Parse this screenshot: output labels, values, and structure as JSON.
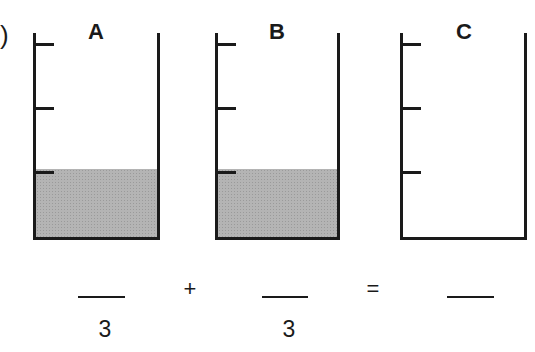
{
  "problem_marker": ")",
  "beakers": [
    {
      "label": "A",
      "ticks": 3,
      "filled_marks": 1,
      "fill_color": "#b4b4b4"
    },
    {
      "label": "B",
      "ticks": 3,
      "filled_marks": 1,
      "fill_color": "#b4b4b4"
    },
    {
      "label": "C",
      "ticks": 3,
      "filled_marks": 0
    }
  ],
  "equation": {
    "term1": {
      "numerator": "",
      "denominator": "3"
    },
    "plus": "+",
    "term2": {
      "numerator": "",
      "denominator": "3"
    },
    "equals": "=",
    "result": {
      "numerator": "",
      "denominator": ""
    }
  }
}
